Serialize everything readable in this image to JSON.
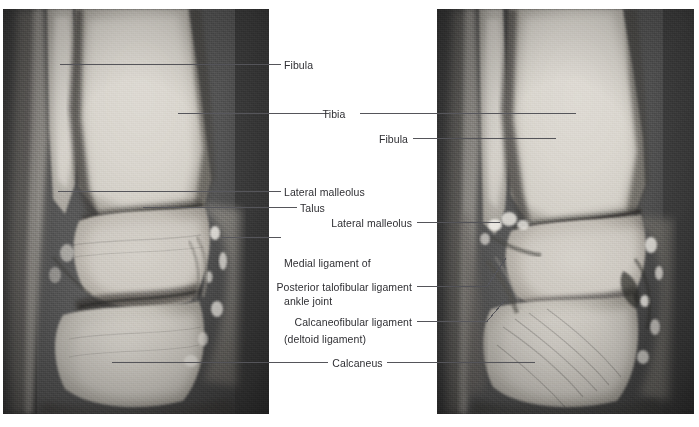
{
  "figure": {
    "background_color": "#ffffff",
    "text_color": "#2f2f33",
    "leader_line_color": "#55555a"
  },
  "panels": [
    {
      "id": "left-mri",
      "name": "coronal-ankle-mri",
      "view": "coronal",
      "x": 3,
      "y": 9,
      "width": 266,
      "height": 405
    },
    {
      "id": "right-mri",
      "name": "sagittal-ankle-mri",
      "view": "sagittal",
      "x": 437,
      "y": 9,
      "width": 257,
      "height": 405
    }
  ],
  "labels": [
    {
      "id": "fibula-left",
      "text": "Fibula",
      "lines": [
        "Fibula"
      ],
      "align": "left",
      "x": 284,
      "y": 59,
      "target_panel": "left-mri"
    },
    {
      "id": "tibia",
      "text": "Tibia",
      "lines": [
        "Tibia"
      ],
      "align": "center",
      "x": 334,
      "y": 108,
      "target_panel": "both"
    },
    {
      "id": "fibula-right",
      "text": "Fibula",
      "lines": [
        "Fibula"
      ],
      "align": "right",
      "x": 380,
      "y": 133,
      "target_panel": "right-mri"
    },
    {
      "id": "lateral-malleolus-left",
      "text": "Lateral malleolus",
      "lines": [
        "Lateral malleolus"
      ],
      "align": "left",
      "x": 284,
      "y": 186,
      "target_panel": "left-mri"
    },
    {
      "id": "talus",
      "text": "Talus",
      "lines": [
        "Talus"
      ],
      "align": "left",
      "x": 300,
      "y": 202,
      "target_panel": "left-mri"
    },
    {
      "id": "lateral-malleolus-right",
      "text": "Lateral malleolus",
      "lines": [
        "Lateral malleolus"
      ],
      "align": "right",
      "x": 414,
      "y": 217,
      "target_panel": "right-mri"
    },
    {
      "id": "medial-ligament",
      "text": "Medial ligament of ankle joint (deltoid ligament)",
      "lines": [
        "Medial ligament of",
        "ankle joint",
        "(deltoid ligament)"
      ],
      "align": "left",
      "x": 284,
      "y": 232,
      "target_panel": "left-mri"
    },
    {
      "id": "posterior-talofibular-ligament",
      "text": "Posterior talofibular ligament",
      "lines": [
        "Posterior talofibular ligament"
      ],
      "align": "right",
      "x": 414,
      "y": 281,
      "target_panel": "right-mri"
    },
    {
      "id": "calcaneofibular-ligament",
      "text": "Calcaneofibular ligament",
      "lines": [
        "Calcaneofibular ligament"
      ],
      "align": "right",
      "x": 414,
      "y": 316,
      "target_panel": "right-mri"
    },
    {
      "id": "calcaneus",
      "text": "Calcaneus",
      "lines": [
        "Calcaneus"
      ],
      "align": "center",
      "x": 356,
      "y": 357,
      "target_panel": "both"
    }
  ]
}
